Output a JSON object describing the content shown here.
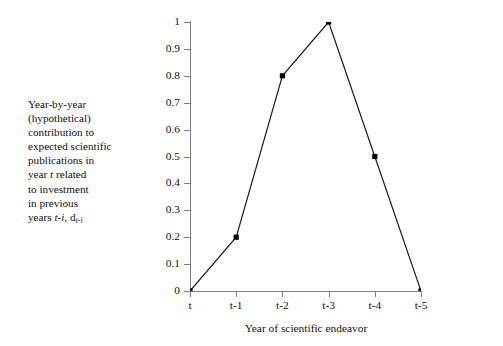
{
  "caption": {
    "lines": [
      "Year-by-year",
      "(hypothetical)",
      "contribution to",
      "expected scientific",
      "publications in",
      "year t  related",
      "to investment",
      "in previous",
      "years t-i, d"
    ],
    "line6_prefix": "year ",
    "line6_italic": "t",
    "line6_suffix": "  related",
    "line9_prefix": "years ",
    "line9_italic": "t-i",
    "line9_mid": ", d",
    "line9_subscript": "t-i"
  },
  "chart_data": {
    "type": "line",
    "title": "",
    "xlabel": "Year of scientific endeavor",
    "ylabel": "",
    "categories": [
      "t",
      "t-1",
      "t-2",
      "t-3",
      "t-4",
      "t-5"
    ],
    "values": [
      0,
      0.2,
      0.8,
      1,
      0.5,
      0
    ],
    "ylim": [
      0,
      1
    ],
    "ytick_labels": [
      "1",
      "0.9",
      "0.8",
      "0.7",
      "0.6",
      "0.5",
      "0.4",
      "0.3",
      "0.2",
      "0.1",
      "0"
    ],
    "ytick_values": [
      1,
      0.9,
      0.8,
      0.7,
      0.6,
      0.5,
      0.4,
      0.3,
      0.2,
      0.1,
      0
    ],
    "grid": false,
    "legend": "none",
    "marker": "square",
    "line_color": "#1a1a1a",
    "marker_color": "#000000",
    "axis_color": "#808080"
  }
}
